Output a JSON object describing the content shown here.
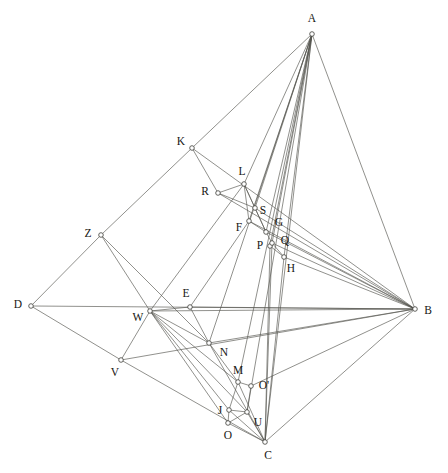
{
  "figure": {
    "width": 448,
    "height": 473,
    "background_color": "#ffffff",
    "line_color": "#55554f",
    "label_color": "#171713",
    "vertex_fill": "#ffffff",
    "vertex_stroke": "#3d3d38",
    "vertex_radius": 2.3
  },
  "points": [
    {
      "id": "A",
      "label": "A",
      "x": 312,
      "y": 34,
      "lx": 312,
      "ly": 19
    },
    {
      "id": "B",
      "label": "B",
      "x": 415,
      "y": 309,
      "lx": 428,
      "ly": 311
    },
    {
      "id": "C",
      "label": "C",
      "x": 265,
      "y": 442,
      "lx": 268,
      "ly": 456
    },
    {
      "id": "D",
      "label": "D",
      "x": 31,
      "y": 306,
      "lx": 18,
      "ly": 305
    },
    {
      "id": "E",
      "label": "E",
      "x": 190,
      "y": 307,
      "lx": 186,
      "ly": 294
    },
    {
      "id": "F",
      "label": "F",
      "x": 249,
      "y": 221,
      "lx": 239,
      "ly": 228
    },
    {
      "id": "G",
      "label": "G",
      "x": 266,
      "y": 232,
      "lx": 279,
      "ly": 223
    },
    {
      "id": "H",
      "label": "H",
      "x": 284,
      "y": 257,
      "lx": 291,
      "ly": 269
    },
    {
      "id": "J",
      "label": "J",
      "x": 229,
      "y": 410,
      "lx": 220,
      "ly": 411
    },
    {
      "id": "K",
      "label": "K",
      "x": 192,
      "y": 148,
      "lx": 181,
      "ly": 142
    },
    {
      "id": "L",
      "label": "L",
      "x": 244,
      "y": 184,
      "lx": 242,
      "ly": 172
    },
    {
      "id": "M",
      "label": "M",
      "x": 238,
      "y": 382,
      "lx": 238,
      "ly": 371
    },
    {
      "id": "N",
      "label": "N",
      "x": 209,
      "y": 343,
      "lx": 224,
      "ly": 353
    },
    {
      "id": "O",
      "label": "O",
      "x": 228,
      "y": 423,
      "lx": 228,
      "ly": 436
    },
    {
      "id": "Op",
      "label": "O'",
      "x": 251,
      "y": 386,
      "lx": 264,
      "ly": 386
    },
    {
      "id": "P",
      "label": "P",
      "x": 270,
      "y": 246,
      "lx": 260,
      "ly": 246
    },
    {
      "id": "Q",
      "label": "Q",
      "x": 272,
      "y": 243,
      "lx": 285,
      "ly": 241
    },
    {
      "id": "R",
      "label": "R",
      "x": 218,
      "y": 193,
      "lx": 205,
      "ly": 192
    },
    {
      "id": "S",
      "label": "S",
      "x": 255,
      "y": 208,
      "lx": 263,
      "ly": 211
    },
    {
      "id": "U",
      "label": "U",
      "x": 247,
      "y": 412,
      "lx": 258,
      "ly": 423
    },
    {
      "id": "V",
      "label": "V",
      "x": 121,
      "y": 360,
      "lx": 115,
      "ly": 373
    },
    {
      "id": "W",
      "label": "W",
      "x": 150,
      "y": 311,
      "lx": 138,
      "ly": 318
    },
    {
      "id": "Z",
      "label": "Z",
      "x": 101,
      "y": 235,
      "lx": 88,
      "ly": 234
    }
  ],
  "edges": [
    [
      "A",
      "K"
    ],
    [
      "A",
      "B"
    ],
    [
      "A",
      "C"
    ],
    [
      "A",
      "L"
    ],
    [
      "A",
      "S"
    ],
    [
      "A",
      "F"
    ],
    [
      "A",
      "G"
    ],
    [
      "A",
      "P"
    ],
    [
      "A",
      "Q"
    ],
    [
      "A",
      "H"
    ],
    [
      "A",
      "N"
    ],
    [
      "A",
      "M"
    ],
    [
      "A",
      "U"
    ],
    [
      "D",
      "B"
    ],
    [
      "D",
      "Z"
    ],
    [
      "D",
      "V"
    ],
    [
      "Z",
      "K"
    ],
    [
      "Z",
      "W"
    ],
    [
      "Z",
      "N"
    ],
    [
      "K",
      "R"
    ],
    [
      "K",
      "B"
    ],
    [
      "R",
      "L"
    ],
    [
      "R",
      "S"
    ],
    [
      "R",
      "B"
    ],
    [
      "L",
      "S"
    ],
    [
      "L",
      "F"
    ],
    [
      "L",
      "G"
    ],
    [
      "L",
      "W"
    ],
    [
      "S",
      "G"
    ],
    [
      "S",
      "B"
    ],
    [
      "F",
      "G"
    ],
    [
      "F",
      "B"
    ],
    [
      "F",
      "E"
    ],
    [
      "G",
      "Q"
    ],
    [
      "G",
      "B"
    ],
    [
      "P",
      "Q"
    ],
    [
      "Q",
      "H"
    ],
    [
      "Q",
      "B"
    ],
    [
      "H",
      "B"
    ],
    [
      "H",
      "P"
    ],
    [
      "E",
      "W"
    ],
    [
      "E",
      "N"
    ],
    [
      "E",
      "B"
    ],
    [
      "W",
      "V"
    ],
    [
      "W",
      "N"
    ],
    [
      "W",
      "M"
    ],
    [
      "W",
      "J"
    ],
    [
      "W",
      "O"
    ],
    [
      "W",
      "U"
    ],
    [
      "W",
      "B"
    ],
    [
      "V",
      "B"
    ],
    [
      "V",
      "C"
    ],
    [
      "N",
      "M"
    ],
    [
      "N",
      "C"
    ],
    [
      "N",
      "B"
    ],
    [
      "M",
      "Op"
    ],
    [
      "M",
      "J"
    ],
    [
      "M",
      "C"
    ],
    [
      "Op",
      "U"
    ],
    [
      "Op",
      "B"
    ],
    [
      "J",
      "O"
    ],
    [
      "J",
      "U"
    ],
    [
      "J",
      "C"
    ],
    [
      "O",
      "C"
    ],
    [
      "O",
      "U"
    ],
    [
      "U",
      "C"
    ],
    [
      "C",
      "B"
    ],
    [
      "C",
      "Q"
    ],
    [
      "C",
      "H"
    ],
    [
      "P",
      "C"
    ]
  ]
}
